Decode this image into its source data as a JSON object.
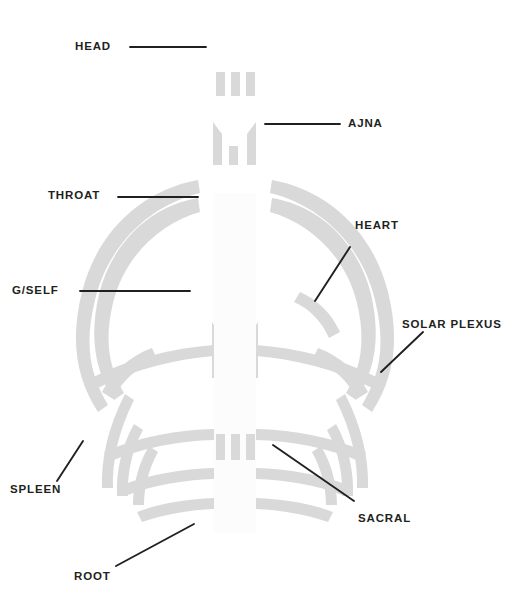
{
  "diagram": {
    "type": "annotated-diagram",
    "background_color": "#ffffff",
    "shape_color": "#d9d9d9",
    "leader_line_color": "#231f20",
    "label_color": "#231f20",
    "width": 517,
    "height": 610
  },
  "labels": [
    {
      "id": "head",
      "text": "HEAD",
      "x": 75,
      "y": 41,
      "leader": {
        "x1": 130,
        "y1": 47,
        "x2": 206,
        "y2": 47,
        "kind": "horizontal"
      }
    },
    {
      "id": "ajna",
      "text": "AJNA",
      "x": 348,
      "y": 118,
      "leader": {
        "x1": 265,
        "y1": 124,
        "x2": 340,
        "y2": 124,
        "kind": "horizontal"
      }
    },
    {
      "id": "throat",
      "text": "THROAT",
      "x": 48,
      "y": 190,
      "leader": {
        "x1": 118,
        "y1": 197,
        "x2": 198,
        "y2": 197,
        "kind": "horizontal"
      }
    },
    {
      "id": "heart",
      "text": "HEART",
      "x": 355,
      "y": 220,
      "leader": {
        "x1": 315,
        "y1": 301,
        "x2": 350,
        "y2": 247,
        "kind": "diagonal"
      }
    },
    {
      "id": "g-self",
      "text": "G/SELF",
      "x": 12,
      "y": 285,
      "leader": {
        "x1": 80,
        "y1": 291,
        "x2": 190,
        "y2": 291,
        "kind": "horizontal"
      }
    },
    {
      "id": "solar-plexus",
      "text": "SOLAR PLEXUS",
      "x": 402,
      "y": 319,
      "leader": {
        "x1": 381,
        "y1": 372,
        "x2": 423,
        "y2": 332,
        "kind": "diagonal"
      }
    },
    {
      "id": "spleen",
      "text": "SPLEEN",
      "x": 10,
      "y": 484,
      "leader": {
        "x1": 57,
        "y1": 481,
        "x2": 83,
        "y2": 441,
        "kind": "diagonal"
      }
    },
    {
      "id": "sacral",
      "text": "SACRAL",
      "x": 358,
      "y": 513,
      "leader": {
        "x1": 273,
        "y1": 445,
        "x2": 354,
        "y2": 501,
        "kind": "diagonal"
      }
    },
    {
      "id": "root",
      "text": "ROOT",
      "x": 74,
      "y": 571,
      "leader": {
        "x1": 116,
        "y1": 566,
        "x2": 194,
        "y2": 524,
        "kind": "diagonal"
      }
    }
  ],
  "centers": [
    {
      "id": "head-center",
      "name": "head",
      "bars": 3
    },
    {
      "id": "ajna-center",
      "name": "ajna",
      "bars": 3
    },
    {
      "id": "throat-center",
      "name": "throat",
      "bars": 3
    },
    {
      "id": "g-center",
      "name": "g-self",
      "bars": 3
    },
    {
      "id": "sacral-center",
      "name": "sacral",
      "bars": 3
    }
  ]
}
